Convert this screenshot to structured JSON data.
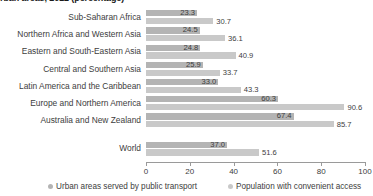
{
  "chart_data": {
    "type": "bar",
    "orientation": "horizontal",
    "title": "rban areas, 2022 (percentage)",
    "xlabel": "",
    "ylabel": "",
    "xlim": [
      0,
      100
    ],
    "xticks": [
      0,
      20,
      40,
      60,
      80,
      100
    ],
    "grid": false,
    "legend_position": "bottom",
    "categories": [
      "Sub-Saharan Africa",
      "Northern Africa and Western Asia",
      "Eastern and South-Eastern Asia",
      "Central and Southern Asia",
      "Latin America and the Caribbean",
      "Europe and Northern America",
      "Australia and New Zealand",
      "World"
    ],
    "series": [
      {
        "name": "Urban areas served by public transport",
        "color": "#b4b4b4",
        "values": [
          23.3,
          24.5,
          24.8,
          25.9,
          33.0,
          60.3,
          67.4,
          37.0
        ],
        "labels": [
          "23.3",
          "24.5",
          "24.8",
          "25.9",
          "33.0",
          "60.3",
          "67.4",
          "37.0"
        ]
      },
      {
        "name": "Population with convenient access",
        "color": "#c9c9c9",
        "values": [
          30.7,
          36.1,
          40.9,
          33.7,
          43.3,
          90.6,
          85.7,
          51.6
        ],
        "labels": [
          "30.7",
          "36.1",
          "40.9",
          "33.7",
          "43.3",
          "90.6",
          "85.7",
          "51.6"
        ]
      }
    ]
  }
}
